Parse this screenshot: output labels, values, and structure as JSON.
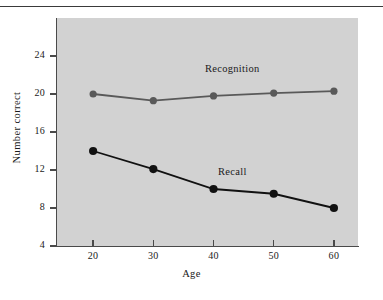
{
  "figure": {
    "background_color": "#ffffff",
    "plot_background_color": "#d2d2d2",
    "has_top_rule": true
  },
  "chart_data": {
    "type": "line",
    "title": "",
    "xlabel": "Age",
    "ylabel": "Number correct",
    "x": [
      20,
      30,
      40,
      50,
      60
    ],
    "xtick_labels": [
      "20",
      "30",
      "40",
      "50",
      "60"
    ],
    "ytick_labels": [
      "4",
      "8",
      "12",
      "16",
      "20",
      "24"
    ],
    "yticks": [
      4,
      8,
      12,
      16,
      20,
      24
    ],
    "xlim": [
      14,
      64
    ],
    "ylim": [
      4,
      28
    ],
    "grid": false,
    "legend": "inline-labels",
    "series": [
      {
        "name": "Recognition",
        "label": "Recognition",
        "color": "#595959",
        "marker": "circle",
        "marker_size": 6,
        "values": [
          20.0,
          19.3,
          19.8,
          20.1,
          20.3
        ]
      },
      {
        "name": "Recall",
        "label": "Recall",
        "color": "#111111",
        "marker": "circle",
        "marker_size": 7,
        "values": [
          14.0,
          12.1,
          10.0,
          9.5,
          8.0
        ]
      }
    ],
    "annotations": [
      {
        "text": "Recognition",
        "x": 43,
        "y": 22.3
      },
      {
        "text": "Recall",
        "x": 45,
        "y": 11.6
      }
    ]
  }
}
